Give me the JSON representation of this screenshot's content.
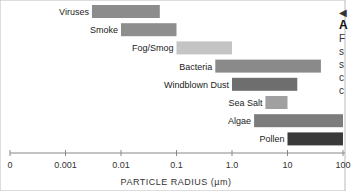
{
  "chart_data": {
    "type": "bar",
    "orientation": "horizontal-range",
    "xlabel": "PARTICLE RADIUS (µm)",
    "xscale": "log",
    "xlim": [
      0.0001,
      100
    ],
    "tick_labels": [
      "0",
      "0.001",
      "0.01",
      "0.1",
      "1.0",
      "10",
      "100"
    ],
    "tick_values": [
      0.0001,
      0.001,
      0.01,
      0.1,
      1,
      10,
      100
    ],
    "series": [
      {
        "name": "Viruses",
        "min": 0.003,
        "max": 0.05,
        "color": "#8c8c8c"
      },
      {
        "name": "Smoke",
        "min": 0.01,
        "max": 0.1,
        "color": "#8e8e8e"
      },
      {
        "name": "Fog/Smog",
        "min": 0.1,
        "max": 1.0,
        "color": "#c4c4c4"
      },
      {
        "name": "Bacteria",
        "min": 0.5,
        "max": 40,
        "color": "#8a8a8a"
      },
      {
        "name": "Windblown Dust",
        "min": 1.0,
        "max": 15,
        "color": "#6e6e6e"
      },
      {
        "name": "Sea Salt",
        "min": 4,
        "max": 10,
        "color": "#a0a0a0"
      },
      {
        "name": "Algae",
        "min": 2.5,
        "max": 100,
        "color": "#7c7c7c"
      },
      {
        "name": "Pollen",
        "min": 10,
        "max": 100,
        "color": "#3a3a3a"
      }
    ]
  },
  "sidebar": {
    "arrow": "◀",
    "heading": "A",
    "lines": [
      "F",
      "s",
      "s",
      "c",
      "c"
    ]
  }
}
